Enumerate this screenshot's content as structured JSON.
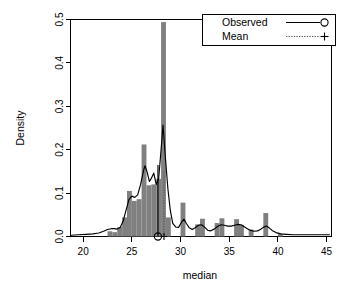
{
  "chart_data": {
    "type": "bar",
    "title": "",
    "subtitle": "",
    "xlabel": "median",
    "ylabel": "Density",
    "xlim": [
      18.7,
      45.5
    ],
    "ylim": [
      0.0,
      0.5
    ],
    "xticks": [
      20,
      25,
      30,
      35,
      40,
      45
    ],
    "xtick_labels": [
      "20",
      "25",
      "30",
      "35",
      "40",
      "45"
    ],
    "yticks": [
      0.0,
      0.1,
      0.2,
      0.3,
      0.4,
      0.5
    ],
    "ytick_labels": [
      "0.0",
      "0.1",
      "0.2",
      "0.3",
      "0.4",
      "0.5"
    ],
    "grid": false,
    "legend_position": "top-right",
    "legend": [
      {
        "label": "Observed",
        "line_style": "solid",
        "marker": "circle",
        "color": "#000000"
      },
      {
        "label": "Mean",
        "line_style": "dotted",
        "marker": "plus",
        "color": "#555555"
      }
    ],
    "histogram": {
      "name": "Bootstrap histogram",
      "color": "#808080",
      "bin_width": 0.5,
      "bins": [
        {
          "x": 22.75,
          "density": 0.012
        },
        {
          "x": 23.25,
          "density": 0.01
        },
        {
          "x": 23.75,
          "density": 0.022
        },
        {
          "x": 24.25,
          "density": 0.044
        },
        {
          "x": 24.75,
          "density": 0.105
        },
        {
          "x": 25.25,
          "density": 0.082
        },
        {
          "x": 25.75,
          "density": 0.086
        },
        {
          "x": 26.25,
          "density": 0.212
        },
        {
          "x": 26.75,
          "density": 0.118
        },
        {
          "x": 27.25,
          "density": 0.12
        },
        {
          "x": 27.75,
          "density": 0.133
        },
        {
          "x": 28.25,
          "density": 0.494
        },
        {
          "x": 28.75,
          "density": 0.044
        },
        {
          "x": 30.25,
          "density": 0.078
        },
        {
          "x": 31.75,
          "density": 0.028
        },
        {
          "x": 32.25,
          "density": 0.041
        },
        {
          "x": 33.75,
          "density": 0.031
        },
        {
          "x": 34.25,
          "density": 0.042
        },
        {
          "x": 35.75,
          "density": 0.04
        },
        {
          "x": 36.25,
          "density": 0.027
        },
        {
          "x": 37.25,
          "density": 0.016
        },
        {
          "x": 38.75,
          "density": 0.054
        },
        {
          "x": 40.25,
          "density": 0.006
        }
      ]
    },
    "series": [
      {
        "name": "Observed",
        "type": "line",
        "color": "#000000",
        "points": [
          [
            18.8,
            0.003
          ],
          [
            19.5,
            0.004
          ],
          [
            20.3,
            0.005
          ],
          [
            21.0,
            0.006
          ],
          [
            21.6,
            0.008
          ],
          [
            22.1,
            0.012
          ],
          [
            22.5,
            0.016
          ],
          [
            22.9,
            0.018
          ],
          [
            23.2,
            0.018
          ],
          [
            23.5,
            0.017
          ],
          [
            23.8,
            0.021
          ],
          [
            24.1,
            0.035
          ],
          [
            24.4,
            0.06
          ],
          [
            24.7,
            0.085
          ],
          [
            25.0,
            0.093
          ],
          [
            25.3,
            0.09
          ],
          [
            25.6,
            0.096
          ],
          [
            25.9,
            0.12
          ],
          [
            26.2,
            0.152
          ],
          [
            26.35,
            0.163
          ],
          [
            26.55,
            0.15
          ],
          [
            26.8,
            0.127
          ],
          [
            27.0,
            0.134
          ],
          [
            27.25,
            0.146
          ],
          [
            27.5,
            0.12
          ],
          [
            27.75,
            0.133
          ],
          [
            28.0,
            0.2
          ],
          [
            28.2,
            0.257
          ],
          [
            28.45,
            0.18
          ],
          [
            28.7,
            0.11
          ],
          [
            28.95,
            0.06
          ],
          [
            29.2,
            0.03
          ],
          [
            29.5,
            0.022
          ],
          [
            29.8,
            0.021
          ],
          [
            30.1,
            0.033
          ],
          [
            30.35,
            0.04
          ],
          [
            30.6,
            0.03
          ],
          [
            30.9,
            0.02
          ],
          [
            31.2,
            0.016
          ],
          [
            31.5,
            0.02
          ],
          [
            31.85,
            0.026
          ],
          [
            32.15,
            0.027
          ],
          [
            32.5,
            0.021
          ],
          [
            32.8,
            0.014
          ],
          [
            33.1,
            0.013
          ],
          [
            33.45,
            0.017
          ],
          [
            33.8,
            0.023
          ],
          [
            34.15,
            0.027
          ],
          [
            34.5,
            0.026
          ],
          [
            34.85,
            0.024
          ],
          [
            35.2,
            0.024
          ],
          [
            35.55,
            0.026
          ],
          [
            35.9,
            0.028
          ],
          [
            36.2,
            0.027
          ],
          [
            36.5,
            0.023
          ],
          [
            36.85,
            0.018
          ],
          [
            37.2,
            0.014
          ],
          [
            37.55,
            0.012
          ],
          [
            37.9,
            0.013
          ],
          [
            38.2,
            0.016
          ],
          [
            38.5,
            0.021
          ],
          [
            38.8,
            0.024
          ],
          [
            39.1,
            0.02
          ],
          [
            39.4,
            0.014
          ],
          [
            39.8,
            0.009
          ],
          [
            40.3,
            0.006
          ],
          [
            40.9,
            0.005
          ],
          [
            41.6,
            0.004
          ],
          [
            42.4,
            0.004
          ],
          [
            43.2,
            0.004
          ],
          [
            44.0,
            0.004
          ],
          [
            44.7,
            0.004
          ],
          [
            45.3,
            0.004
          ]
        ]
      }
    ],
    "annotations": [
      {
        "name": "observed-marker",
        "label": "Observed",
        "x": 27.68,
        "y": 0.0,
        "marker": "circle",
        "vline": true,
        "vline_top": 0.165,
        "color": "#000000"
      },
      {
        "name": "mean-marker",
        "label": "Mean",
        "x": 28.3,
        "y": 0.0,
        "marker": "plus",
        "vline": true,
        "vline_top": 0.15,
        "color": "#555555"
      }
    ]
  }
}
